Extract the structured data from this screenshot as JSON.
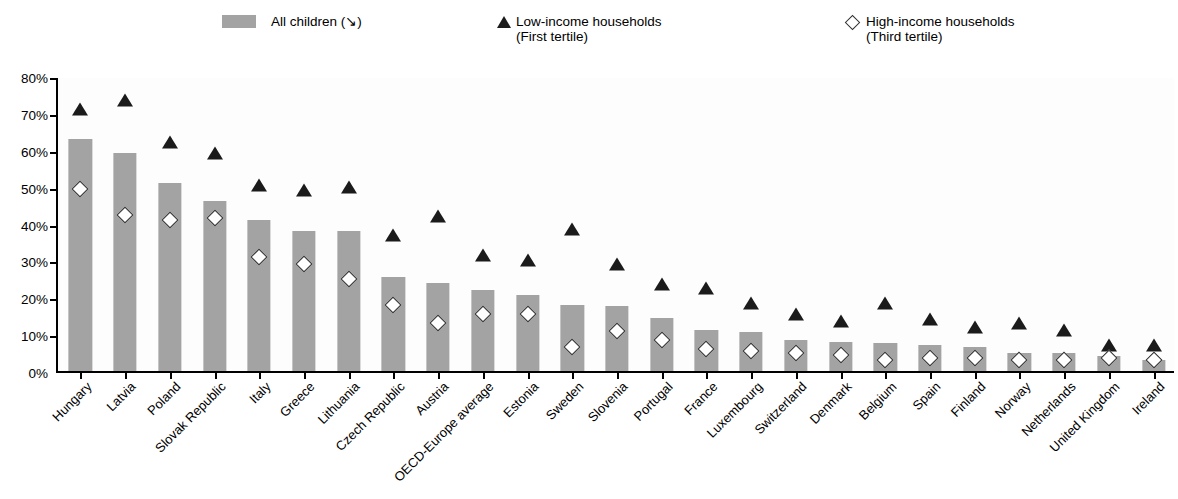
{
  "legend": {
    "items": [
      {
        "marker": "bar-swatch",
        "label_line1": "All children (↘)",
        "label_line2": ""
      },
      {
        "marker": "triangle",
        "label_line1": "Low-income households",
        "label_line2": "(First tertile)"
      },
      {
        "marker": "diamond",
        "label_line1": "High-income households",
        "label_line2": "(Third tertile)"
      }
    ]
  },
  "axis": {
    "y_ticks": [
      "0%",
      "10%",
      "20%",
      "30%",
      "40%",
      "50%",
      "60%",
      "70%",
      "80%"
    ]
  },
  "colors": {
    "bar_fill": "#a3a3a3",
    "triangle_fill": "#1b1b1b",
    "diamond_fill": "#ffffff",
    "diamond_stroke": "#2b2b2b",
    "axis": "#000000",
    "plot_background": "#fdfdfd"
  },
  "chart_data": {
    "type": "bar",
    "title": "",
    "subtitle": "",
    "xlabel": "",
    "ylabel": "",
    "ylim": [
      0,
      80
    ],
    "ytick_step": 10,
    "grid": false,
    "legend_position": "top",
    "categories": [
      "Hungary",
      "Latvia",
      "Poland",
      "Slovak Republic",
      "Italy",
      "Greece",
      "Lithuania",
      "Czech Republic",
      "Austria",
      "OECD-Europe average",
      "Estonia",
      "Sweden",
      "Slovenia",
      "Portugal",
      "France",
      "Luxembourg",
      "Switzerland",
      "Denmark",
      "Belgium",
      "Spain",
      "Finland",
      "Norway",
      "Netherlands",
      "United Kingdom",
      "Ireland"
    ],
    "series": [
      {
        "name": "All children",
        "type": "bar",
        "values": [
          63,
          59,
          51,
          46,
          41,
          38,
          38,
          25.5,
          24,
          22,
          20.5,
          18,
          17.5,
          14.5,
          11,
          10.5,
          8.5,
          8,
          7.5,
          7,
          6.5,
          5,
          5,
          4,
          3
        ]
      },
      {
        "name": "Low-income households (First tertile)",
        "type": "marker-triangle",
        "values": [
          71,
          73.5,
          62,
          59,
          50.5,
          49,
          50,
          37,
          42,
          31.5,
          30,
          38.5,
          29,
          23.5,
          22.5,
          18.5,
          15.5,
          13.5,
          18.5,
          14,
          12,
          13,
          11,
          7,
          7
        ]
      },
      {
        "name": "High-income households (Third tertile)",
        "type": "marker-diamond",
        "values": [
          47.5,
          40.5,
          39,
          39.5,
          29,
          27,
          23,
          16,
          11,
          13.5,
          13.5,
          4.5,
          9,
          6.5,
          4,
          3.5,
          3,
          2.5,
          1,
          1.5,
          1.5,
          1,
          1,
          1.5,
          1
        ]
      }
    ]
  }
}
